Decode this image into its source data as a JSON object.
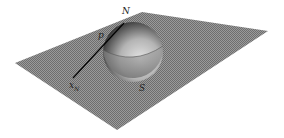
{
  "figure": {
    "labels": {
      "north": "N",
      "point": "p",
      "projection_base": "x",
      "projection_sub": "N",
      "south": "S"
    },
    "colors": {
      "plane": "#8a8a8a",
      "sphere_light": "#d8d8d8",
      "sphere_dark": "#1e1e1e",
      "line": "#000000",
      "background": "#ffffff"
    }
  }
}
